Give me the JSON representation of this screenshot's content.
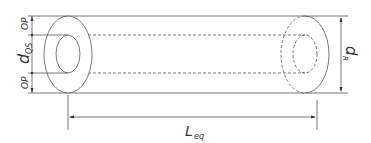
{
  "diagram": {
    "labels": {
      "op_top": "OP",
      "op_bottom": "OP",
      "d_main": "d",
      "d_sub": "QS",
      "dr_main": "d",
      "dr_sub": "R",
      "l_main": "L",
      "l_sub": "eq"
    },
    "colors": {
      "line": "#555555",
      "text": "#333333"
    }
  }
}
